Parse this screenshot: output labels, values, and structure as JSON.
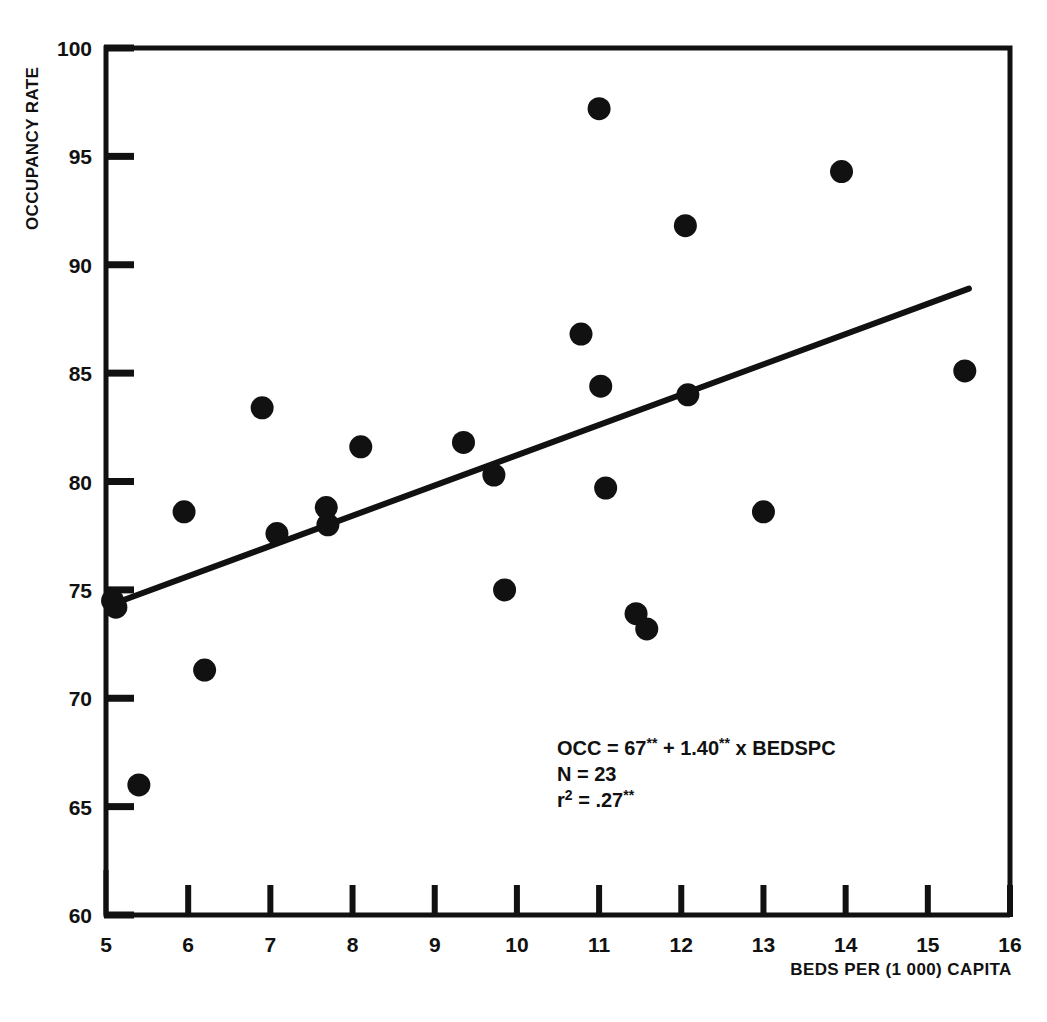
{
  "figure": {
    "background_color": "#ffffff",
    "ink_color": "#111111",
    "marker_color": "#111111"
  },
  "axes": {
    "y_title": "OCCUPANCY RATE",
    "x_title": "BEDS PER (1 000) CAPITA",
    "y_ticks": [
      "60",
      "65",
      "70",
      "75",
      "80",
      "85",
      "90",
      "95",
      "100"
    ],
    "x_ticks": [
      "5",
      "6",
      "7",
      "8",
      "9",
      "10",
      "11",
      "12",
      "13",
      "14",
      "15",
      "16"
    ]
  },
  "annotation": {
    "line1_prefix": "OCC = 67",
    "line1_star1": "**",
    "line1_mid": " + 1.40",
    "line1_star2": "**",
    "line1_suffix": " x BEDSPC",
    "line2": "N = 23",
    "line3_r": "r",
    "line3_sup": "2",
    "line3_rest": " = .27",
    "line3_star": "**"
  },
  "chart_data": {
    "type": "scatter",
    "title": "",
    "xlabel": "BEDS PER (1 000) CAPITA",
    "ylabel": "OCCUPANCY RATE",
    "xlim": [
      5,
      16
    ],
    "ylim": [
      60,
      100
    ],
    "xticks": [
      5,
      6,
      7,
      8,
      9,
      10,
      11,
      12,
      13,
      14,
      15,
      16
    ],
    "yticks": [
      60,
      65,
      70,
      75,
      80,
      85,
      90,
      95,
      100
    ],
    "grid": false,
    "legend": null,
    "n_points": 23,
    "points": [
      {
        "x": 5.08,
        "y": 74.5
      },
      {
        "x": 5.12,
        "y": 74.2
      },
      {
        "x": 5.4,
        "y": 66.0
      },
      {
        "x": 5.95,
        "y": 78.6
      },
      {
        "x": 6.2,
        "y": 71.3
      },
      {
        "x": 6.9,
        "y": 83.4
      },
      {
        "x": 7.08,
        "y": 77.6
      },
      {
        "x": 7.68,
        "y": 78.8
      },
      {
        "x": 7.7,
        "y": 78.0
      },
      {
        "x": 8.1,
        "y": 81.6
      },
      {
        "x": 9.35,
        "y": 81.8
      },
      {
        "x": 9.72,
        "y": 80.3
      },
      {
        "x": 9.85,
        "y": 75.0
      },
      {
        "x": 10.78,
        "y": 86.8
      },
      {
        "x": 11.0,
        "y": 97.2
      },
      {
        "x": 11.02,
        "y": 84.4
      },
      {
        "x": 11.08,
        "y": 79.7
      },
      {
        "x": 11.45,
        "y": 73.9
      },
      {
        "x": 11.58,
        "y": 73.2
      },
      {
        "x": 12.05,
        "y": 91.8
      },
      {
        "x": 12.08,
        "y": 84.0
      },
      {
        "x": 13.0,
        "y": 78.6
      },
      {
        "x": 13.95,
        "y": 94.3
      },
      {
        "x": 15.45,
        "y": 85.1
      }
    ],
    "fit_line": {
      "equation": "OCC = 67 + 1.40 x BEDSPC",
      "intercept": 67.0,
      "slope": 1.4,
      "r_squared": 0.27,
      "n": 23,
      "x_start": 5.05,
      "y_start": 74.3,
      "x_end": 15.5,
      "y_end": 88.9
    }
  }
}
